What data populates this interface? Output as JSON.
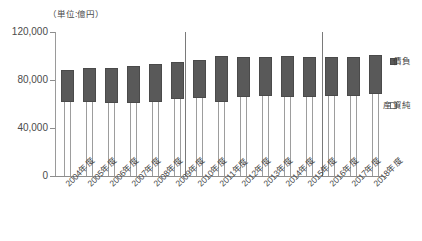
{
  "chart_data": {
    "type": "bar",
    "subtype": "stacked-column",
    "title": "",
    "unit_caption": "（単位:億円）",
    "xlabel": "",
    "ylabel": "",
    "ylim": [
      0,
      120000
    ],
    "ytick_labels": [
      "120,000",
      "80,000",
      "40,000",
      "0"
    ],
    "ytick_values": [
      120000,
      80000,
      40000,
      0
    ],
    "grid": true,
    "grid_axis": "y",
    "legend_position": "right",
    "categories": [
      "2004年度",
      "2005年度",
      "2006年度",
      "2007年度",
      "2008年度",
      "2009年度",
      "2010年度",
      "2011年度",
      "2012年度",
      "2013年度",
      "2014年度",
      "2015年度",
      "2016年度",
      "2017年度",
      "2018年度"
    ],
    "series": [
      {
        "name": "純資産",
        "color": "#ffffff",
        "values": [
          62000,
          62000,
          61000,
          61000,
          62000,
          64000,
          65000,
          62000,
          66000,
          67000,
          66000,
          66000,
          67000,
          67000,
          68000
        ]
      },
      {
        "name": "負債",
        "color": "#595959",
        "values": [
          26000,
          28000,
          29000,
          31000,
          31000,
          31000,
          32000,
          38000,
          33000,
          32000,
          34000,
          33000,
          32000,
          32000,
          33000
        ]
      }
    ],
    "totals": [
      88000,
      90000,
      90000,
      92000,
      93000,
      95000,
      97000,
      100000,
      99000,
      99000,
      100000,
      99000,
      99000,
      99000,
      101000
    ],
    "dividers_after_category": [
      "2009年度",
      "2014年度"
    ]
  },
  "legend": {
    "items": [
      {
        "label": "負債",
        "swatch": "dark-square"
      },
      {
        "label": "純資産",
        "swatch": "white-square"
      }
    ]
  }
}
